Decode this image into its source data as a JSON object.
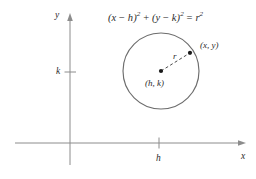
{
  "figure": {
    "title_equation": "(x − h)² + (y − k)² = r²",
    "equation_parts": {
      "open1": "(",
      "x": "x",
      "minus1": " − ",
      "h": "h",
      "close1": ")",
      "sq1": "2",
      "plus": " + ",
      "open2": "(",
      "y": "y",
      "minus2": " − ",
      "k": "k",
      "close2": ")",
      "sq2": "2",
      "equals": " = ",
      "r": "r",
      "sq3": "2"
    },
    "axes": {
      "y_axis_label": "y",
      "x_axis_label": "x",
      "x_tick_label": "h",
      "y_tick_label": "k"
    },
    "annotations": {
      "center_label": "(h, k)",
      "point_label": "(x, y)",
      "radius_label": "r"
    },
    "colors": {
      "background": "#ffffff",
      "axis": "#8c8c8c",
      "circle": "#6d6d6d",
      "dash": "#4a4a4a",
      "text": "#2b2b2b",
      "dot": "#1a1a1a"
    },
    "geometry": {
      "circle_center_x": 161,
      "circle_center_y": 71,
      "circle_radius": 38,
      "x_axis_y": 143,
      "y_axis_x": 70,
      "point_x": 190,
      "point_y": 53
    }
  }
}
